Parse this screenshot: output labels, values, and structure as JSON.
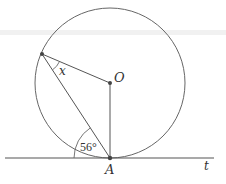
{
  "diagram": {
    "type": "circle-tangent-geometry",
    "colors": {
      "stroke": "#555555",
      "point": "#444444",
      "artifact_band": "#eeeeee"
    },
    "circle": {
      "center_label": "O",
      "cx": 110,
      "cy": 83,
      "r": 75
    },
    "points": {
      "O": {
        "label": "O",
        "x": 110,
        "y": 83
      },
      "A": {
        "label": "A",
        "x": 110,
        "y": 158
      },
      "P": {
        "label": "",
        "x": 42,
        "y": 54
      }
    },
    "tangent": {
      "label": "t",
      "x1": 5,
      "x2": 214,
      "y": 158
    },
    "angles": {
      "x_angle": {
        "label": "x",
        "vertex": "P",
        "between": [
          "PO",
          "PA"
        ]
      },
      "tangent_chord_angle": {
        "label": "56°",
        "vertex": "A",
        "between": [
          "t (left)",
          "AP"
        ],
        "value_deg": 56
      }
    },
    "segments": [
      "PO",
      "PA",
      "OA"
    ]
  }
}
